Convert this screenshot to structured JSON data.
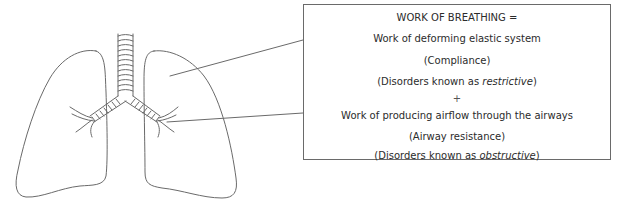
{
  "diagram": {
    "title": "WORK OF BREATHING =",
    "components": [
      {
        "label": "Work of deforming elastic system",
        "property": "(Compliance)",
        "disorders_prefix": "(Disorders known as ",
        "disorders_type": "restrictive",
        "disorders_suffix": ")",
        "points_to": "lung-parenchyma"
      },
      {
        "label": "Work of producing airflow through the airways",
        "property": "(Airway resistance)",
        "disorders_prefix": "(Disorders known as ",
        "disorders_type": "obstructive",
        "disorders_suffix": ")",
        "points_to": "bronchi"
      }
    ],
    "operator": "+",
    "figure": {
      "structures": [
        "trachea",
        "left-main-bronchus",
        "right-main-bronchus",
        "left-lung",
        "right-lung"
      ],
      "line_color": "#6a6a6a"
    }
  }
}
